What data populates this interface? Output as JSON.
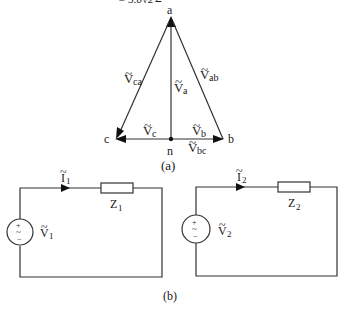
{
  "top_text_fragment": "= 5.0√2∠°",
  "phasor_diagram": {
    "caption": "(a)",
    "nodes": {
      "a": {
        "label": "a"
      },
      "b": {
        "label": "b"
      },
      "c": {
        "label": "c"
      },
      "n": {
        "label": "n"
      }
    },
    "vectors": {
      "ca": {
        "name": "V",
        "sub": "ca"
      },
      "ab": {
        "name": "V",
        "sub": "ab"
      },
      "a": {
        "name": "V",
        "sub": "a"
      },
      "b": {
        "name": "V",
        "sub": "b"
      },
      "c": {
        "name": "V",
        "sub": "c"
      },
      "bc": {
        "name": "V",
        "sub": "bc"
      }
    }
  },
  "circuits": {
    "caption": "(b)",
    "left": {
      "current": {
        "name": "I",
        "sub": "1"
      },
      "impedance": {
        "name": "Z",
        "sub": "1"
      },
      "source": {
        "name": "V",
        "sub": "1",
        "plus": "+",
        "tilde": "~",
        "minus": "−"
      }
    },
    "right": {
      "current": {
        "name": "I",
        "sub": "2"
      },
      "impedance": {
        "name": "Z",
        "sub": "2"
      },
      "source": {
        "name": "V",
        "sub": "2",
        "plus": "+",
        "tilde": "~",
        "minus": "−"
      }
    }
  }
}
